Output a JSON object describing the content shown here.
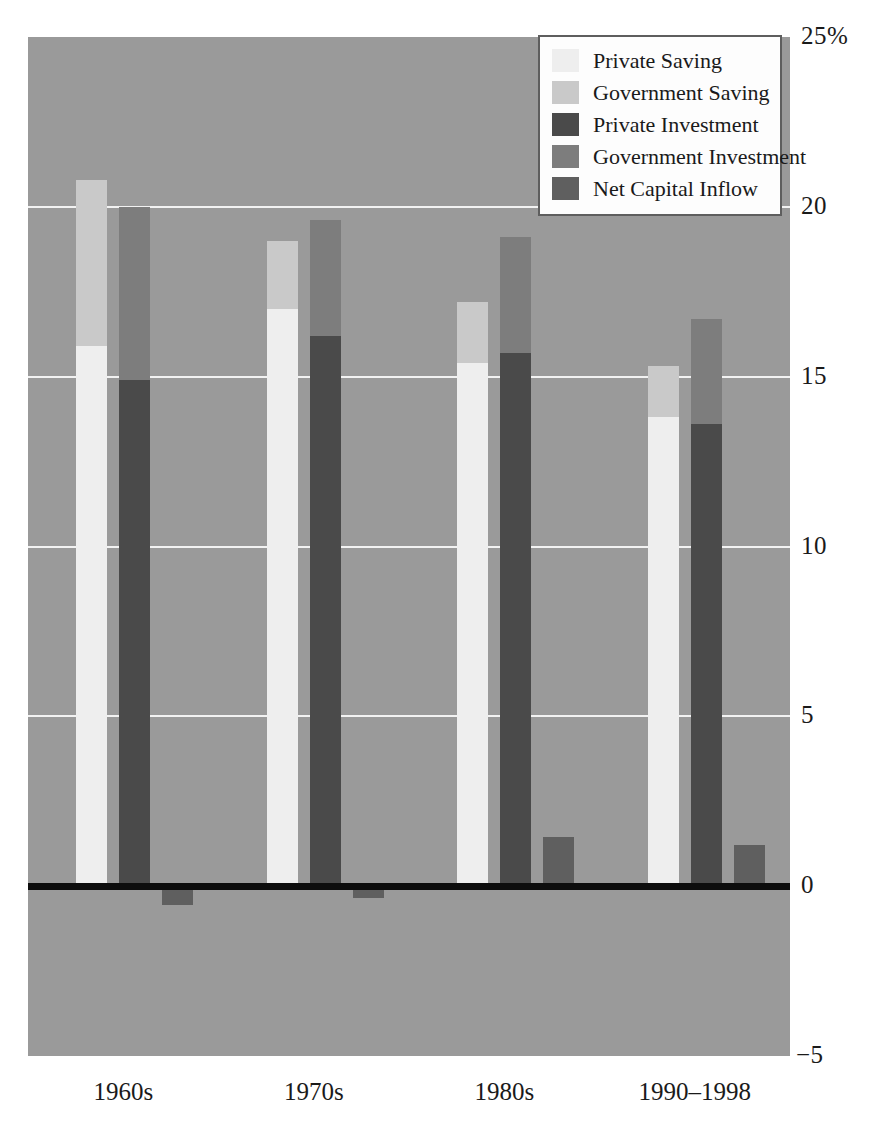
{
  "chart_data": {
    "type": "bar",
    "title": "",
    "subtitle": "",
    "xlabel": "",
    "ylabel": "",
    "ylim": [
      -5,
      25
    ],
    "yticks": [
      {
        "value": 25,
        "label": "25%"
      },
      {
        "value": 20,
        "label": "20"
      },
      {
        "value": 15,
        "label": "15"
      },
      {
        "value": 10,
        "label": "10"
      },
      {
        "value": 5,
        "label": "5"
      },
      {
        "value": 0,
        "label": "0"
      },
      {
        "value": -5,
        "label": "−5"
      }
    ],
    "grid": true,
    "gridlines": [
      20,
      15,
      10,
      5
    ],
    "zero_line": true,
    "legend_position": "top-right",
    "categories": [
      "1960s",
      "1970s",
      "1980s",
      "1990–1998"
    ],
    "colors": {
      "plot_background": "#9a9a9a",
      "gridline": "#f2f2f2",
      "zero_line": "#0d0d0d",
      "private_saving": "#eeeeee",
      "government_saving": "#c9c9c9",
      "private_investment": "#4a4a4a",
      "government_investment": "#7d7d7d",
      "net_capital_inflow": "#5f5f5f",
      "legend_background": "#fdfdfd",
      "legend_border": "#5e5e5e",
      "text": "#1a1a1a"
    },
    "legend": [
      {
        "name": "Private Saving",
        "color": "#eeeeee"
      },
      {
        "name": "Government Saving",
        "color": "#c9c9c9"
      },
      {
        "name": "Private Investment",
        "color": "#4a4a4a"
      },
      {
        "name": "Government Investment",
        "color": "#7d7d7d"
      },
      {
        "name": "Net Capital Inflow",
        "color": "#5f5f5f"
      }
    ],
    "stacks": [
      {
        "name": "Saving",
        "series": [
          "Private Saving",
          "Government Saving"
        ],
        "values_by_category": {
          "1960s": [
            15.9,
            4.9
          ],
          "1970s": [
            17.0,
            2.0
          ],
          "1980s": [
            15.4,
            1.8
          ],
          "1990–1998": [
            13.8,
            1.5
          ]
        },
        "totals": {
          "1960s": 20.8,
          "1970s": 19.0,
          "1980s": 17.2,
          "1990–1998": 15.3
        }
      },
      {
        "name": "Investment and Net Capital Inflow",
        "series": [
          "Private Investment",
          "Government Investment"
        ],
        "values_by_category": {
          "1960s": [
            14.9,
            5.1
          ],
          "1970s": [
            16.2,
            3.4
          ],
          "1980s": [
            15.7,
            3.4
          ],
          "1990–1998": [
            13.6,
            3.1
          ]
        },
        "totals": {
          "1960s": 20.0,
          "1970s": 19.6,
          "1980s": 19.1,
          "1990–1998": 16.7
        }
      }
    ],
    "net_capital_inflow": {
      "series_name": "Net Capital Inflow",
      "values_by_category": {
        "1960s": -0.55,
        "1970s": -0.35,
        "1980s": 1.45,
        "1990–1998": 1.2
      }
    },
    "series": [
      {
        "name": "Private Saving",
        "values": [
          15.9,
          17.0,
          15.4,
          13.8
        ]
      },
      {
        "name": "Government Saving",
        "values": [
          4.9,
          2.0,
          1.8,
          1.5
        ]
      },
      {
        "name": "Private Investment",
        "values": [
          14.9,
          16.2,
          15.7,
          13.6
        ]
      },
      {
        "name": "Government Investment",
        "values": [
          5.1,
          3.4,
          3.4,
          3.1
        ]
      },
      {
        "name": "Net Capital Inflow",
        "values": [
          -0.55,
          -0.35,
          1.45,
          1.2
        ]
      }
    ]
  }
}
